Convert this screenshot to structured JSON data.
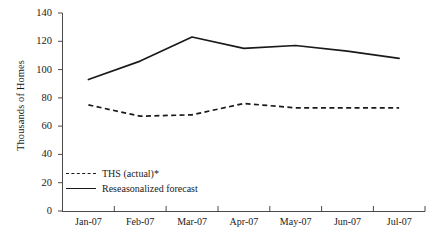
{
  "chart_data": {
    "type": "line",
    "title": "",
    "xlabel": "",
    "ylabel": "Thousands of Homes",
    "categories": [
      "Jan-07",
      "Feb-07",
      "Mar-07",
      "Apr-07",
      "May-07",
      "Jun-07",
      "Jul-07"
    ],
    "ylim": [
      0,
      140
    ],
    "yticks": [
      0,
      20,
      40,
      60,
      80,
      100,
      120,
      140
    ],
    "grid": false,
    "legend_position": "inside-bottom-left",
    "series": [
      {
        "name": "THS (actual)*",
        "style": "dashed",
        "values": [
          75,
          67,
          68,
          76,
          73,
          73,
          73
        ]
      },
      {
        "name": "Reseasonalized forecast",
        "style": "solid",
        "values": [
          93,
          106,
          123,
          115,
          117,
          113,
          108
        ]
      }
    ]
  },
  "axis": {
    "y_title": "Thousands of Homes",
    "y_tick_labels": [
      "140",
      "120",
      "100",
      "80",
      "60",
      "40",
      "20",
      "0"
    ],
    "x_tick_labels": [
      "Jan-07",
      "Feb-07",
      "Mar-07",
      "Apr-07",
      "May-07",
      "Jun-07",
      "Jul-07"
    ]
  },
  "legend": {
    "items": [
      {
        "label": "THS (actual)*",
        "style": "dashed"
      },
      {
        "label": "Reseasonalized forecast",
        "style": "solid"
      }
    ]
  },
  "colors": {
    "line": "#1a1a1a",
    "axis": "#4a4a4a",
    "background": "#ffffff"
  }
}
